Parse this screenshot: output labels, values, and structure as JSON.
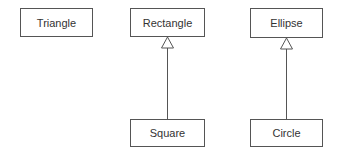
{
  "diagram": {
    "type": "uml-class-inheritance",
    "colors": {
      "line": "#555555",
      "text": "#333333",
      "background": "#ffffff"
    },
    "classes": [
      {
        "id": "triangle",
        "label": "Triangle",
        "x": 20,
        "y": 8,
        "w": 73,
        "h": 29
      },
      {
        "id": "rectangle",
        "label": "Rectangle",
        "x": 130,
        "y": 8,
        "w": 75,
        "h": 29
      },
      {
        "id": "ellipse",
        "label": "Ellipse",
        "x": 250,
        "y": 8,
        "w": 73,
        "h": 30
      },
      {
        "id": "square",
        "label": "Square",
        "x": 130,
        "y": 119,
        "w": 75,
        "h": 28
      },
      {
        "id": "circle",
        "label": "Circle",
        "x": 250,
        "y": 119,
        "w": 73,
        "h": 28
      }
    ],
    "relations": [
      {
        "from": "Square",
        "to": "Rectangle",
        "kind": "generalization"
      },
      {
        "from": "Circle",
        "to": "Ellipse",
        "kind": "generalization"
      }
    ]
  }
}
